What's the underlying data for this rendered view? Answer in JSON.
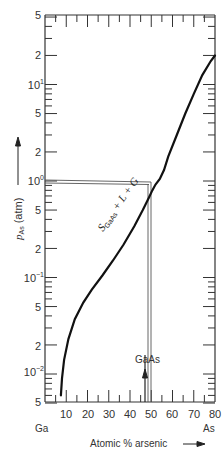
{
  "chart_data": {
    "type": "line",
    "title": "",
    "xlabel": "Atomic % arsenic",
    "ylabel": "p_As (atm)",
    "yscale": "log",
    "xlim": [
      0,
      80
    ],
    "ylim": [
      0.005,
      50
    ],
    "grid": false,
    "legend": null,
    "x_ticks": [
      10,
      20,
      30,
      40,
      50,
      60,
      70,
      80
    ],
    "x_tick_labels": [
      "10",
      "20",
      "30",
      "40",
      "50",
      "60",
      "70",
      "80"
    ],
    "y_tick_labels": [
      "5",
      "2",
      "10¹",
      "5",
      "2",
      "10⁰",
      "5",
      "2",
      "10⁻¹",
      "5",
      "2",
      "10⁻²",
      "5"
    ],
    "y_tick_values": [
      50,
      20,
      10,
      5,
      2,
      1,
      0.5,
      0.2,
      0.1,
      0.05,
      0.02,
      0.01,
      0.005
    ],
    "x_end_labels": {
      "left": "Ga",
      "right": "As"
    },
    "series": [
      {
        "name": "S_GaAs + L + G three-phase line",
        "x": [
          7.5,
          8,
          9,
          11,
          14,
          18,
          22,
          27,
          32,
          37,
          42,
          46,
          49,
          50.5,
          52,
          54,
          56,
          58,
          62,
          66,
          70,
          74,
          78,
          81
        ],
        "y": [
          0.006,
          0.009,
          0.014,
          0.023,
          0.037,
          0.055,
          0.075,
          0.105,
          0.15,
          0.22,
          0.34,
          0.5,
          0.68,
          0.8,
          0.92,
          1.05,
          1.3,
          1.8,
          3.0,
          5.0,
          8.0,
          12.5,
          17.5,
          20
        ]
      }
    ],
    "annotations": [
      {
        "text": "S_GaAs + L + G",
        "x": 38,
        "y": 0.45,
        "rotation": -55
      },
      {
        "text": "GaAs",
        "x": 50,
        "y": 0.014,
        "arrow": "up",
        "note": "vertical line at 50 at.% As"
      },
      {
        "text": "horizontal reference line at p_As = 1 atm",
        "x_from": 0,
        "x_to": 52,
        "y": 1.0
      },
      {
        "text": "vertical drop line",
        "x": 52,
        "y_from": 1.0,
        "y_to": 0.005
      }
    ]
  },
  "labels": {
    "ylabel_main": "p",
    "ylabel_sub": "As",
    "ylabel_unit": "(atm)",
    "xlabel": "Atomic % arsenic",
    "ga": "Ga",
    "as": "As",
    "gaas": "GaAs",
    "region_s": "S",
    "region_sub": "GaAs",
    "region_rest": " + L + G"
  },
  "ticks": {
    "y_major": [
      {
        "label": "5",
        "y": 15
      },
      {
        "label": "2",
        "y": 55
      },
      {
        "label": "10",
        "sup": "1",
        "y": 85
      },
      {
        "label": "5",
        "y": 113
      },
      {
        "label": "2",
        "y": 152
      },
      {
        "label": "10",
        "sup": "0",
        "y": 181
      },
      {
        "label": "5",
        "y": 210
      },
      {
        "label": "2",
        "y": 249
      },
      {
        "label": "10",
        "sup": "−1",
        "y": 278
      },
      {
        "label": "5",
        "y": 307
      },
      {
        "label": "2",
        "y": 346
      },
      {
        "label": "10",
        "sup": "−2",
        "y": 372
      },
      {
        "label": "5",
        "y": 402
      }
    ],
    "x_major": [
      {
        "label": "10",
        "x": 66
      },
      {
        "label": "20",
        "x": 88
      },
      {
        "label": "30",
        "x": 109
      },
      {
        "label": "40",
        "x": 130
      },
      {
        "label": "50",
        "x": 151
      },
      {
        "label": "60",
        "x": 172
      },
      {
        "label": "70",
        "x": 194
      },
      {
        "label": "80",
        "x": 215
      }
    ]
  }
}
